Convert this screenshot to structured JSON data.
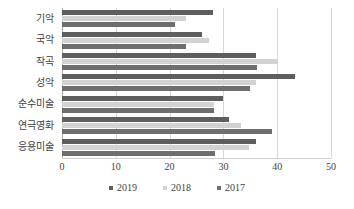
{
  "chart_data": {
    "type": "bar",
    "orientation": "horizontal",
    "title": "",
    "xlabel": "",
    "ylabel": "",
    "xlim": [
      0,
      50
    ],
    "xticks": [
      0,
      10,
      20,
      30,
      40,
      50
    ],
    "grid": true,
    "legend_position": "bottom",
    "categories": [
      "기악",
      "국악",
      "작곡",
      "성악",
      "순수미술",
      "연극영화",
      "응용미술"
    ],
    "series": [
      {
        "name": "2019",
        "color": "#5e5e5e",
        "values": [
          28.0,
          26.0,
          36.0,
          43.3,
          30.0,
          31.0,
          36.0
        ]
      },
      {
        "name": "2018",
        "color": "#d2d2d2",
        "values": [
          23.0,
          27.3,
          40.2,
          36.0,
          28.3,
          33.2,
          34.7
        ]
      },
      {
        "name": "2017",
        "color": "#6e6e6e",
        "values": [
          21.0,
          23.0,
          36.3,
          35.0,
          28.3,
          39.0,
          28.4
        ]
      }
    ]
  },
  "legend": {
    "items": [
      {
        "label": "2019",
        "swatch": "legend-swatch-2019"
      },
      {
        "label": "2018",
        "swatch": "legend-swatch-2018"
      },
      {
        "label": "2017",
        "swatch": "legend-swatch-2017"
      }
    ]
  },
  "colors": {
    "series_2019": "#5e5e5e",
    "series_2018": "#d2d2d2",
    "series_2017": "#6e6e6e",
    "gridline": "#d9d9d9",
    "axis": "#b0b0b0",
    "text": "#3f3f3f",
    "background": "#ffffff"
  }
}
